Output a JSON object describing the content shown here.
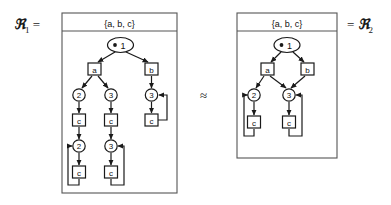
{
  "figure": {
    "left_label": "ℜ",
    "left_label_sub": "1",
    "left_label_eq": "=",
    "right_label_eq": "=",
    "right_label": "ℜ",
    "right_label_sub": "2",
    "relation_symbol": "≈",
    "background_color": "#ffffff",
    "stroke_color": "#1a1a1a",
    "node_fill": "#ffffff"
  },
  "left_graph": {
    "name": "R1",
    "header": "{a, b, c}",
    "root": {
      "id": "L-root",
      "label": "1",
      "bullet": true,
      "shape": "ellipse"
    },
    "boxes": [
      {
        "id": "L-a",
        "label": "a"
      },
      {
        "id": "L-b",
        "label": "b"
      },
      {
        "id": "L-c1",
        "label": "c"
      },
      {
        "id": "L-c2",
        "label": "c"
      },
      {
        "id": "L-c3",
        "label": "c"
      },
      {
        "id": "L-c4",
        "label": "c"
      },
      {
        "id": "L-c5",
        "label": "c"
      }
    ],
    "circles": [
      {
        "id": "L-2a",
        "label": "2"
      },
      {
        "id": "L-3a",
        "label": "3"
      },
      {
        "id": "L-3b",
        "label": "3"
      },
      {
        "id": "L-2b",
        "label": "2"
      },
      {
        "id": "L-3c",
        "label": "3"
      }
    ],
    "edge_count": 14
  },
  "right_graph": {
    "name": "R2",
    "header": "{a, b, c}",
    "root": {
      "id": "R-root",
      "label": "1",
      "bullet": true,
      "shape": "ellipse"
    },
    "boxes": [
      {
        "id": "R-a",
        "label": "a"
      },
      {
        "id": "R-b",
        "label": "b"
      },
      {
        "id": "R-c1",
        "label": "c"
      },
      {
        "id": "R-c2",
        "label": "c"
      }
    ],
    "circles": [
      {
        "id": "R-2",
        "label": "2"
      },
      {
        "id": "R-3",
        "label": "3"
      }
    ],
    "edge_count": 8
  }
}
